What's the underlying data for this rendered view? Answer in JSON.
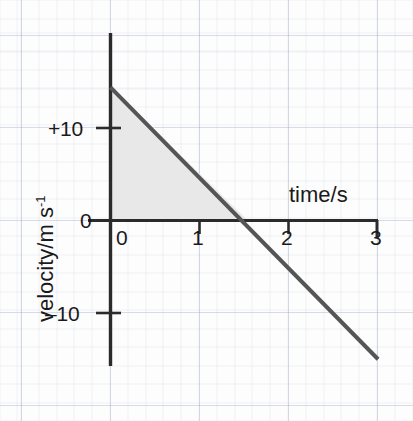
{
  "chart_data": {
    "type": "line",
    "title": "",
    "subtitle": "",
    "xlabel": "time/s",
    "ylabel": "velocity/m s",
    "ylabel_exponent": "-1",
    "xlim": [
      0,
      3
    ],
    "ylim": [
      -15,
      15
    ],
    "x_ticks": [
      "0",
      "1",
      "2",
      "3"
    ],
    "x_tick_values": [
      0,
      1,
      2,
      3
    ],
    "y_ticks": [
      "+10",
      "0",
      "–10"
    ],
    "y_tick_values": [
      10,
      0,
      -10
    ],
    "grid": true,
    "grid_style": "graph-paper",
    "legend": "none",
    "series": [
      {
        "name": "velocity",
        "x": [
          0,
          3
        ],
        "values": [
          14.4,
          -15.0
        ],
        "color": "#555555",
        "line_width": 4
      }
    ],
    "zero_crossing_time": 1.54,
    "annotations": [
      {
        "name": "shaded-area-under-line",
        "type": "filled-triangle",
        "vertices": [
          [
            0,
            0
          ],
          [
            0,
            14.4
          ],
          [
            1.54,
            0
          ]
        ],
        "fill": "#e8e8e8"
      }
    ]
  },
  "axes": {
    "y_axis_color": "#2b2b2b",
    "x_axis_color": "#2b2b2b",
    "axis_width": 3
  },
  "colors": {
    "background": "#fdfdfd",
    "grid_minor": "#c6ccdd",
    "grid_major": "#aab2c8",
    "line": "#555555",
    "shade": "#e8e8e8",
    "text": "#1a1a1a"
  }
}
